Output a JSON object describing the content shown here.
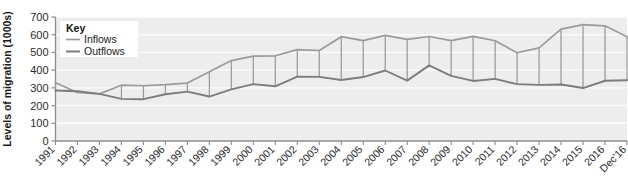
{
  "chart_data": {
    "type": "line",
    "title": "",
    "xlabel": "",
    "ylabel": "Levels of migration (1000s)",
    "ylim": [
      0,
      700
    ],
    "ytick_step": 100,
    "grid": true,
    "legend_position": "top-left",
    "legend_title": "Key",
    "categories": [
      "1991",
      "1992",
      "1993",
      "1994",
      "1995",
      "1996",
      "1997",
      "1998",
      "1999",
      "2000",
      "2001",
      "2002",
      "2003",
      "2004",
      "2005",
      "2006",
      "2007",
      "2008",
      "2009",
      "2010",
      "2011",
      "2012",
      "2013",
      "2014",
      "2015",
      "2016",
      "Dec'16"
    ],
    "ytick_labels": [
      "0",
      "100",
      "200",
      "300",
      "400",
      "500",
      "600",
      "700"
    ],
    "series": [
      {
        "name": "Inflows",
        "color": "#9b9b9b",
        "values": [
          329,
          274,
          266,
          315,
          312,
          318,
          327,
          391,
          454,
          479,
          481,
          516,
          511,
          589,
          567,
          596,
          574,
          590,
          567,
          591,
          566,
          498,
          526,
          632,
          657,
          650,
          588
        ]
      },
      {
        "name": "Outflows",
        "color": "#7d7d7d",
        "values": [
          285,
          281,
          266,
          238,
          236,
          264,
          279,
          251,
          291,
          321,
          309,
          363,
          362,
          344,
          361,
          398,
          341,
          427,
          368,
          339,
          351,
          321,
          317,
          319,
          299,
          340,
          343
        ]
      }
    ]
  }
}
